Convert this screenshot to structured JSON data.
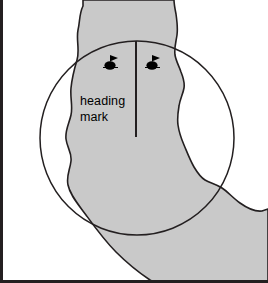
{
  "figure": {
    "name": "radar-heading-mark-channel-diagram",
    "type": "nautical-radar-illustration",
    "background_color": "#ffffff",
    "border_color": "#231f20"
  },
  "channel": {
    "name": "channel-waterway",
    "fill_color": "#c9c9c9",
    "outline_color": "#231f20",
    "description": "shaded navigable channel bending from top of frame toward bottom right"
  },
  "range_circle": {
    "name": "radar-range-ring",
    "stroke_color": "#231f20",
    "center_x": 137,
    "center_y": 138,
    "radius": 97
  },
  "heading_mark": {
    "name": "heading-mark-line",
    "label_line1": "heading",
    "label_line2": "mark",
    "stroke_color": "#231f20",
    "x": 136,
    "y_top": 41,
    "y_bottom": 137,
    "label_x": 80,
    "label_y1": 100,
    "label_y2": 117
  },
  "buoys": [
    {
      "name": "buoy-marker-left",
      "x": 110,
      "y": 63,
      "color": "#000000"
    },
    {
      "name": "buoy-marker-right",
      "x": 152,
      "y": 63,
      "color": "#000000"
    }
  ]
}
